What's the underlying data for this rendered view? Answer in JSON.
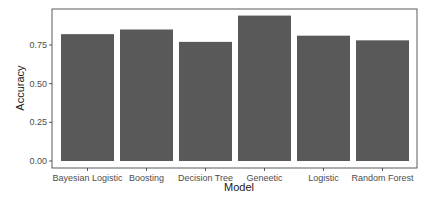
{
  "chart_data": {
    "type": "bar",
    "title": "",
    "xlabel": "Model",
    "ylabel": "Accuracy",
    "categories": [
      "Bayesian Logistic",
      "Boosting",
      "Decision Tree",
      "Geneetic",
      "Logistic",
      "Random Forest"
    ],
    "values": [
      0.82,
      0.85,
      0.77,
      0.94,
      0.81,
      0.78
    ],
    "ylim": [
      0,
      0.97
    ],
    "yticks": [
      "0.00",
      "0.25",
      "0.50",
      "0.75"
    ],
    "ytick_values": [
      0,
      0.25,
      0.5,
      0.75
    ],
    "grid": false,
    "legend": null,
    "bar_color": "#595959",
    "panel_border_color": "#333333"
  }
}
